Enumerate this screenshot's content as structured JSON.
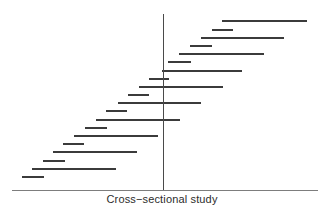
{
  "figure": {
    "title": "",
    "caption": "Cross−sectional study",
    "background_color": "#ffffff",
    "width": 324,
    "height": 217
  },
  "axis": {
    "baseline_color": "#6f6f6f",
    "baseline_y": 190,
    "baseline_x_start": 12,
    "baseline_x_end": 318,
    "caption_label": "Cross−sectional study"
  },
  "reference_line": {
    "label": "null-effect-reference",
    "color": "#4a4a4a",
    "x": 163,
    "y_top": 14,
    "y_bottom": 190
  },
  "chart_data": {
    "type": "line",
    "title": "",
    "subtitle": "",
    "xlabel": "Cross−sectional study",
    "ylabel": "",
    "grid": false,
    "legend": null,
    "xlim": [
      12,
      318
    ],
    "ylim": [
      14,
      190
    ],
    "series_color": "#3b3b3b",
    "series": [
      {
        "name": "interval-segments",
        "description": "Horizontal interval bars arranged in a descending staircase, alternating long and short spans, crossed by a vertical reference line.",
        "segments": [
          {
            "index": 1,
            "y": 21,
            "x_start": 222,
            "x_end": 307,
            "length": 85,
            "kind": "long"
          },
          {
            "index": 2,
            "y": 30,
            "x_start": 212,
            "x_end": 233,
            "length": 21,
            "kind": "short"
          },
          {
            "index": 3,
            "y": 38,
            "x_start": 201,
            "x_end": 284,
            "length": 83,
            "kind": "long"
          },
          {
            "index": 4,
            "y": 46,
            "x_start": 190,
            "x_end": 212,
            "length": 22,
            "kind": "short"
          },
          {
            "index": 5,
            "y": 54,
            "x_start": 179,
            "x_end": 264,
            "length": 85,
            "kind": "long"
          },
          {
            "index": 6,
            "y": 62,
            "x_start": 168,
            "x_end": 191,
            "length": 23,
            "kind": "short"
          },
          {
            "index": 7,
            "y": 71,
            "x_start": 162,
            "x_end": 242,
            "length": 80,
            "kind": "long"
          },
          {
            "index": 8,
            "y": 79,
            "x_start": 149,
            "x_end": 169,
            "length": 20,
            "kind": "short"
          },
          {
            "index": 9,
            "y": 87,
            "x_start": 139,
            "x_end": 223,
            "length": 84,
            "kind": "long"
          },
          {
            "index": 10,
            "y": 95,
            "x_start": 128,
            "x_end": 149,
            "length": 21,
            "kind": "short"
          },
          {
            "index": 11,
            "y": 103,
            "x_start": 118,
            "x_end": 201,
            "length": 83,
            "kind": "long"
          },
          {
            "index": 12,
            "y": 111,
            "x_start": 106,
            "x_end": 127,
            "length": 21,
            "kind": "short"
          },
          {
            "index": 13,
            "y": 120,
            "x_start": 96,
            "x_end": 180,
            "length": 84,
            "kind": "long"
          },
          {
            "index": 14,
            "y": 128,
            "x_start": 85,
            "x_end": 107,
            "length": 22,
            "kind": "short"
          },
          {
            "index": 15,
            "y": 136,
            "x_start": 74,
            "x_end": 158,
            "length": 84,
            "kind": "long"
          },
          {
            "index": 16,
            "y": 144,
            "x_start": 63,
            "x_end": 84,
            "length": 21,
            "kind": "short"
          },
          {
            "index": 17,
            "y": 152,
            "x_start": 53,
            "x_end": 137,
            "length": 84,
            "kind": "long"
          },
          {
            "index": 18,
            "y": 161,
            "x_start": 43,
            "x_end": 65,
            "length": 22,
            "kind": "short"
          },
          {
            "index": 19,
            "y": 169,
            "x_start": 32,
            "x_end": 116,
            "length": 84,
            "kind": "long"
          },
          {
            "index": 20,
            "y": 177,
            "x_start": 22,
            "x_end": 44,
            "length": 22,
            "kind": "short"
          }
        ]
      }
    ]
  }
}
